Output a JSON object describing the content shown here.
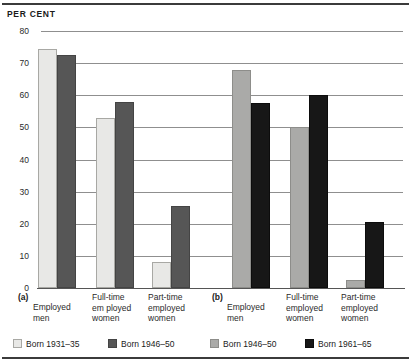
{
  "figure": {
    "axis_title": "PER CENT"
  },
  "chart_data": {
    "type": "bar",
    "title": "PER CENT",
    "xlabel": "",
    "ylabel": "PER CENT",
    "ylim": [
      0,
      80
    ],
    "yticks": [
      0,
      10,
      20,
      30,
      40,
      50,
      60,
      70,
      80
    ],
    "ytick_labels": [
      "0",
      "10",
      "20",
      "30",
      "40",
      "50",
      "60",
      "70",
      "80"
    ],
    "grid": true,
    "legend_position": "bottom",
    "panels": [
      {
        "id": "a",
        "label": "(a)",
        "categories": [
          "Employed men",
          "Full-time em ployed women",
          "Part-time employed women"
        ],
        "series": [
          {
            "name": "Born 1931–35",
            "color": "#e8e8e6",
            "values": [
              74.5,
              53,
              8
            ]
          },
          {
            "name": "Born 1946–50",
            "color": "#565656",
            "values": [
              72.5,
              58,
              25.5
            ]
          }
        ]
      },
      {
        "id": "b",
        "label": "(b)",
        "categories": [
          "Employed men",
          "Full-time employed women",
          "Part-time employed women"
        ],
        "series": [
          {
            "name": "Born 1946–50",
            "color": "#aaaaa8",
            "values": [
              68,
              50,
              2.5
            ]
          },
          {
            "name": "Born 1961–65",
            "color": "#171717",
            "values": [
              57.5,
              60,
              20.5
            ]
          }
        ]
      }
    ]
  },
  "x_axis": {
    "groups": [
      {
        "label": "(a)",
        "categories": [
          {
            "lines": [
              "Employed",
              "men"
            ]
          },
          {
            "lines": [
              "Full-time",
              "em ployed",
              "women"
            ]
          },
          {
            "lines": [
              "Part-time",
              "employed",
              "women"
            ]
          }
        ]
      },
      {
        "label": "(b)",
        "categories": [
          {
            "lines": [
              "Employed",
              "men"
            ]
          },
          {
            "lines": [
              "Full-time",
              "employed",
              "women"
            ]
          },
          {
            "lines": [
              "Part-time",
              "employed",
              "women"
            ]
          }
        ]
      }
    ]
  },
  "legend": {
    "entries": [
      {
        "label": "Born 1931–35",
        "color": "#e8e8e6",
        "swatch": "sw1"
      },
      {
        "label": "Born 1946–50",
        "color": "#565656",
        "swatch": "sw2"
      },
      {
        "label": "Born 1946–50",
        "color": "#aaaaa8",
        "swatch": "sw3"
      },
      {
        "label": "Born 1961–65",
        "color": "#171717",
        "swatch": "sw4"
      }
    ]
  },
  "colors": {
    "rule": "#3b3b3b",
    "grid": "#8f8f8f",
    "born_1931_35": "#e8e8e6",
    "born_1946_50_a": "#565656",
    "born_1946_50_b": "#aaaaa8",
    "born_1961_65": "#171717"
  }
}
